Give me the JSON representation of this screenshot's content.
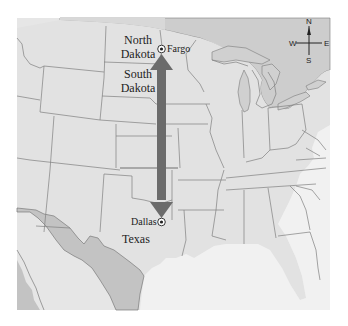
{
  "map": {
    "title": "",
    "colors": {
      "land": "#e4e4e4",
      "land_us": "#dedede",
      "canada": "#c8c8c8",
      "mexico": "#c2c2c2",
      "water": "#f0f0f0",
      "lakes": "#cfcfcf",
      "border": "#7a7a7a",
      "arrow": "#6e6e6e"
    },
    "state_labels": [
      {
        "id": "north-dakota",
        "text": "North\nDakota",
        "line1": "North",
        "line2": "Dakota"
      },
      {
        "id": "south-dakota",
        "text": "South\nDakota",
        "line1": "South",
        "line2": "Dakota"
      },
      {
        "id": "texas",
        "text": "Texas"
      }
    ],
    "cities": [
      {
        "id": "fargo",
        "name": "Fargo"
      },
      {
        "id": "dallas",
        "name": "Dallas"
      }
    ],
    "arrow": {
      "from": "Fargo",
      "to": "Dallas",
      "double_headed": true,
      "direction": "north-south"
    },
    "compass": {
      "n": "N",
      "s": "S",
      "e": "E",
      "w": "W"
    }
  }
}
